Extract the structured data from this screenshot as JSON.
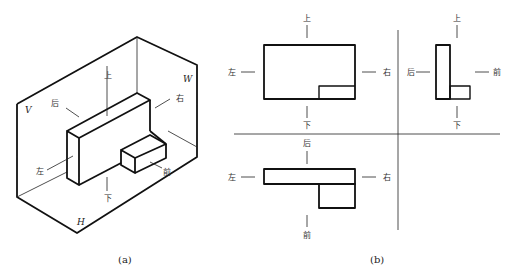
{
  "figure_a": {
    "caption": "(a)",
    "planes": {
      "V": "V",
      "W": "W",
      "H": "H"
    },
    "direction_labels": {
      "top": "上",
      "bottom": "下",
      "left": "左",
      "right": "右",
      "back": "后",
      "front": "前"
    }
  },
  "figure_b": {
    "caption": "(b)",
    "front_view": {
      "top": "上",
      "bottom": "下",
      "left": "左",
      "right": "右"
    },
    "side_view": {
      "top": "上",
      "bottom": "下",
      "left": "后",
      "right": "前"
    },
    "top_view": {
      "top": "后",
      "bottom": "前",
      "left": "左",
      "right": "右"
    }
  }
}
